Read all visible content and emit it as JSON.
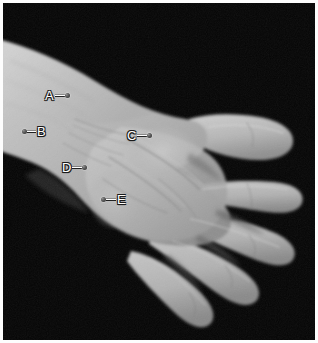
{
  "figure": {
    "view": "palmar",
    "border_color": "#fdfdfd",
    "background_color": "#040404",
    "skin_light": "#c9c9c9",
    "skin_mid": "#b0b0b0",
    "skin_shadow": "#8d8d8d",
    "label_text_color": "#ffffff",
    "label_outline_color": "#1a1a1a",
    "marker_color": "#4a4a4a"
  },
  "labels": [
    {
      "id": "A",
      "text": "A",
      "marker_side": "right",
      "letter_left": 42,
      "letter_top": 86,
      "leader_length": 10,
      "dot_x": 68,
      "dot_y": 94,
      "region": "distal-forearm-dorsal-radial"
    },
    {
      "id": "B",
      "text": "B",
      "marker_side": "left",
      "letter_left": 40,
      "letter_top": 122,
      "leader_length": 9,
      "dot_x": 22,
      "dot_y": 130,
      "region": "ulnar-border-of-forearm"
    },
    {
      "id": "C",
      "text": "C",
      "marker_side": "right",
      "letter_left": 124,
      "letter_top": 126,
      "leader_length": 10,
      "dot_x": 150,
      "dot_y": 134,
      "region": "thenar-eminence"
    },
    {
      "id": "D",
      "text": "D",
      "marker_side": "right",
      "letter_left": 59,
      "letter_top": 158,
      "leader_length": 10,
      "dot_x": 86,
      "dot_y": 166,
      "region": "wrist-crease-ulnar"
    },
    {
      "id": "E",
      "text": "E",
      "marker_side": "left",
      "letter_left": 117,
      "letter_top": 190,
      "leader_length": 10,
      "dot_x": 101,
      "dot_y": 198,
      "region": "hypothenar-eminence"
    }
  ],
  "anatomy_notes": {
    "visible_parts": [
      "forearm",
      "wrist",
      "palm",
      "thumb",
      "index-finger",
      "middle-finger",
      "ring-finger",
      "little-finger"
    ]
  }
}
